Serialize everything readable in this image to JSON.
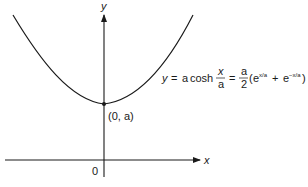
{
  "diagram": {
    "axes": {
      "x_label": "x",
      "y_label": "y",
      "origin_label": "0"
    },
    "curve": {
      "name": "catenary",
      "vertex_label": "(0, a)"
    },
    "equation": {
      "lhs": "y",
      "eq1": "=",
      "coeff": "a",
      "func": "cosh",
      "frac1_num": "x",
      "frac1_den": "a",
      "eq2": "=",
      "frac2_num": "a",
      "frac2_den": "2",
      "paren_open": "(",
      "exp_base1": "e",
      "exp_pow1": "x/a",
      "plus": "+",
      "exp_base2": "e",
      "exp_pow2": "−x/a",
      "paren_close": ")"
    }
  },
  "colors": {
    "ink": "#1a1a1a",
    "background": "#ffffff"
  }
}
